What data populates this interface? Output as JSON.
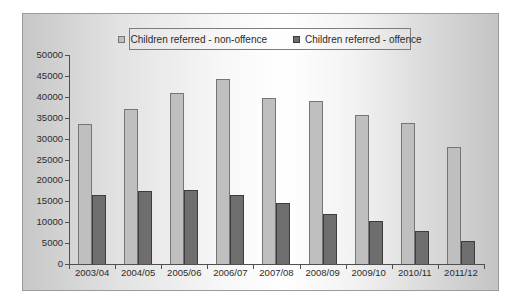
{
  "chart_data": {
    "type": "bar",
    "title": "",
    "xlabel": "",
    "ylabel": "",
    "categories": [
      "2003/04",
      "2004/05",
      "2005/06",
      "2006/07",
      "2007/08",
      "2008/09",
      "2009/10",
      "2010/11",
      "2011/12"
    ],
    "series": [
      {
        "name": "Children referred - non-offence",
        "fill_color": "#bfbfbf",
        "border_color": "#757575",
        "values": [
          33500,
          37200,
          40800,
          44300,
          39800,
          39000,
          35700,
          33800,
          27900
        ]
      },
      {
        "name": "Children referred - offence",
        "fill_color": "#6e6e6e",
        "border_color": "#3c3c3c",
        "values": [
          16600,
          17500,
          17800,
          16600,
          14700,
          11900,
          10200,
          8000,
          5500
        ]
      }
    ],
    "ylim": [
      0,
      50000
    ],
    "ytick_step": 5000,
    "ytick_labels": [
      "0",
      "5000",
      "10000",
      "15000",
      "20000",
      "25000",
      "30000",
      "35000",
      "40000",
      "45000",
      "50000"
    ],
    "grid": false,
    "legend_position": "top-center",
    "background": {
      "chart_border_color": "#9a9a9a",
      "axis_color": "#4f4f4f",
      "gradient": [
        "#c7c7c7",
        "#ffffff",
        "#c4c4c4"
      ]
    }
  }
}
